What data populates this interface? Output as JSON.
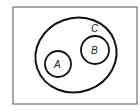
{
  "diagram": {
    "type": "venn",
    "universe": {
      "x": 13,
      "y": 7,
      "width": 124,
      "height": 97,
      "stroke": "#555555"
    },
    "sets": [
      {
        "name": "C",
        "label": "C",
        "shape": "ellipse",
        "cx": 76,
        "cy": 55,
        "rx": 41,
        "ry": 37,
        "rotate": -20,
        "label_x": 93,
        "label_y": 32
      },
      {
        "name": "A",
        "label": "A",
        "shape": "circle",
        "cx": 58,
        "cy": 64,
        "r": 13
      },
      {
        "name": "B",
        "label": "B",
        "shape": "circle",
        "cx": 95,
        "cy": 50,
        "r": 14
      }
    ],
    "relations": [
      "A ⊂ C",
      "B ⊂ C",
      "A ∩ B = ∅"
    ]
  }
}
